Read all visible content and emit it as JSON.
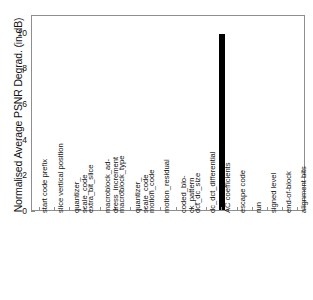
{
  "chart_data": {
    "type": "bar",
    "title": "",
    "xlabel": "",
    "ylabel": "Normalised Average PSNR Degrad. (in dB)",
    "ylim": [
      0,
      11
    ],
    "yticks": [
      0,
      2,
      4,
      6,
      8,
      10
    ],
    "grid": false,
    "legend": null,
    "bar_color": "#000000",
    "frame_color": "#8e8e8e",
    "categories": [
      "start code prefix",
      "slice vertical position",
      "quantizer_\nscale_code",
      "extra_bit_slice",
      "macroblock_ad-\ndress_increment",
      "macroblock_type",
      "quantizer_\nscale_code",
      "motion_code",
      "motion_residual",
      "coded_blo-\nck_pattern",
      "dct_dc_size",
      "dc_dct_differential",
      "AC coefficients",
      "escape code",
      "run",
      "signed level",
      "end-of-block",
      "alignment bits"
    ],
    "values": [
      0,
      0,
      0,
      0,
      0,
      0,
      0,
      0,
      0,
      0,
      0,
      0,
      9.9,
      0,
      0,
      0,
      0,
      0
    ]
  }
}
